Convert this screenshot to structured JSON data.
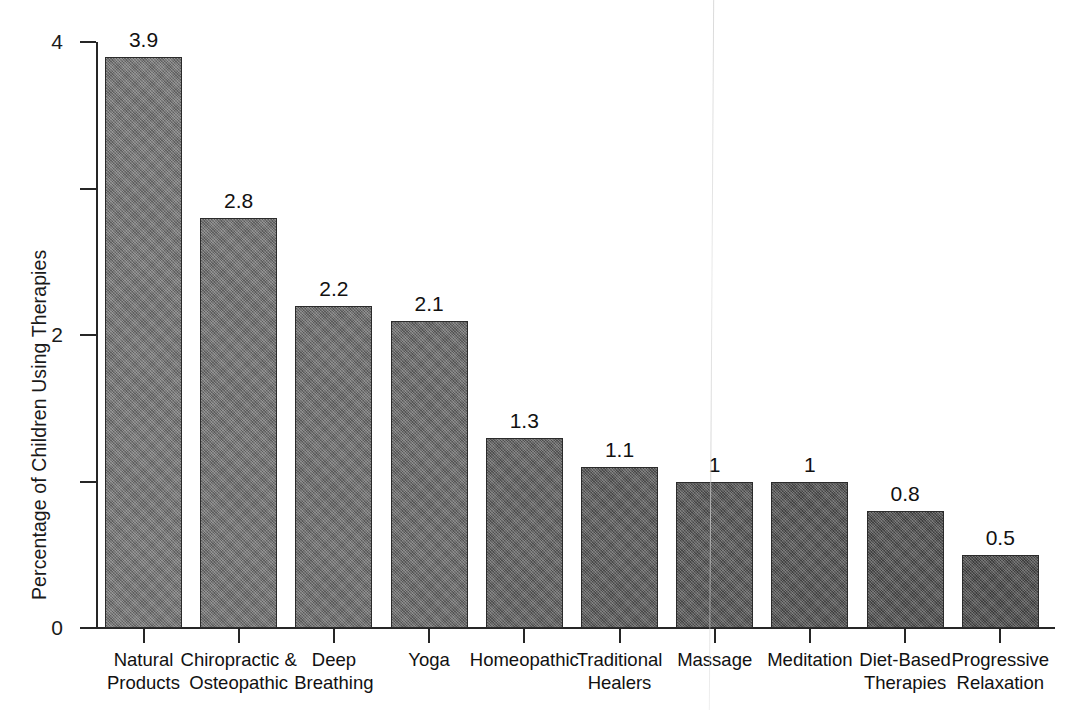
{
  "chart_data": {
    "type": "bar",
    "title": "",
    "subtitle": "",
    "xlabel": "",
    "ylabel": "Percentage of Children Using Therapies",
    "ylim": [
      0,
      4
    ],
    "y_ticks": [
      0,
      1,
      2,
      3,
      4
    ],
    "y_tick_labels": [
      "0",
      "",
      "2",
      "",
      "4"
    ],
    "grid": false,
    "legend": null,
    "bar_color": "#6d6d6d",
    "bar_edge_color": "#2b2b2b",
    "axis_color": "#262626",
    "categories": [
      "Natural Products",
      "Chiropractic & Osteopathic",
      "Deep Breathing",
      "Yoga",
      "Homeopathic",
      "Traditional Healers",
      "Massage",
      "Meditation",
      "Diet-Based Therapies",
      "Progressive Relaxation"
    ],
    "category_lines": [
      [
        "Natural",
        "Products"
      ],
      [
        "Chiropractic &",
        "Osteopathic"
      ],
      [
        "Deep",
        "Breathing"
      ],
      [
        "Yoga",
        ""
      ],
      [
        "Homeopathic",
        ""
      ],
      [
        "Traditional",
        "Healers"
      ],
      [
        "Massage",
        ""
      ],
      [
        "Meditation",
        ""
      ],
      [
        "Diet-Based",
        "Therapies"
      ],
      [
        "Progressive",
        "Relaxation"
      ]
    ],
    "values": [
      3.9,
      2.8,
      2.2,
      2.1,
      1.3,
      1.1,
      1,
      1,
      0.8,
      0.5
    ],
    "value_labels": [
      "3.9",
      "2.8",
      "2.2",
      "2.1",
      "1.3",
      "1.1",
      "1",
      "1",
      "0.8",
      "0.5"
    ]
  }
}
